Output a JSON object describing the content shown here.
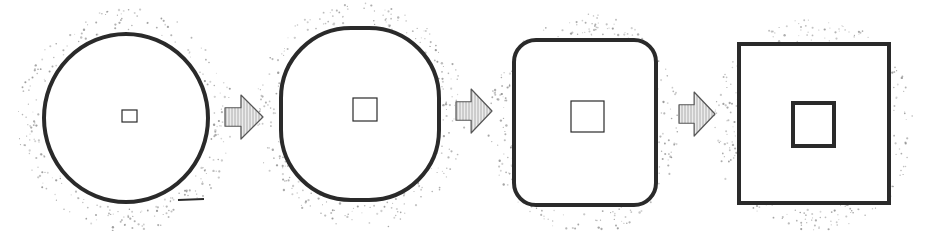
{
  "diagram": {
    "colors": {
      "background": "#ffffff",
      "stroke": "#2a2a2a",
      "stipple": "#8a8a8a",
      "arrow_fill": "#e4e4e4"
    },
    "stages": [
      {
        "id": 1,
        "shape": "circle",
        "outer": {
          "cx": 126,
          "cy": 118,
          "rx": 82,
          "ry": 84
        },
        "inner": {
          "x": 122,
          "y": 110,
          "w": 15,
          "h": 12,
          "stroke": 1.2
        }
      },
      {
        "id": 2,
        "shape": "rounded-circle",
        "outer": {
          "x": 281,
          "y": 28,
          "w": 158,
          "h": 172,
          "r": 70
        },
        "inner": {
          "x": 353,
          "y": 98,
          "w": 24,
          "h": 23,
          "stroke": 1.2
        }
      },
      {
        "id": 3,
        "shape": "rounded-square",
        "outer": {
          "x": 514,
          "y": 40,
          "w": 142,
          "h": 165,
          "r": 22
        },
        "inner": {
          "x": 571,
          "y": 101,
          "w": 33,
          "h": 31,
          "stroke": 1.2
        }
      },
      {
        "id": 4,
        "shape": "square",
        "outer": {
          "x": 739,
          "y": 44,
          "w": 150,
          "h": 159,
          "r": 0
        },
        "inner": {
          "x": 793,
          "y": 103,
          "w": 41,
          "h": 43,
          "stroke": 4
        }
      }
    ],
    "arrows": [
      {
        "from": 1,
        "to": 2,
        "x": 225,
        "y": 95,
        "w": 38,
        "h": 44,
        "direction": "right"
      },
      {
        "from": 2,
        "to": 3,
        "x": 456,
        "y": 89,
        "w": 36,
        "h": 44,
        "direction": "right"
      },
      {
        "from": 3,
        "to": 4,
        "x": 679,
        "y": 92,
        "w": 36,
        "h": 44,
        "direction": "right"
      }
    ]
  }
}
